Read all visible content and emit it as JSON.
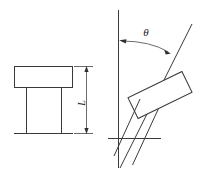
{
  "figure": {
    "background_color": "#ffffff",
    "line_color": "#3a3a3a",
    "label_color": "#1d1d1d",
    "width": 201,
    "height": 181
  },
  "left_view": {
    "name": "upright-view",
    "description": "T-shaped structure standing upright on a baseline",
    "head": {
      "shape": "rectangle",
      "x": 14,
      "y": 66,
      "width": 59,
      "height": 22
    },
    "legs": [
      {
        "x": 26,
        "y_top": 88,
        "y_bottom": 133
      },
      {
        "x": 61,
        "y_top": 88,
        "y_bottom": 133
      }
    ],
    "baseline": {
      "x_start": 14,
      "x_end": 73,
      "y": 133
    },
    "dimension": {
      "label": "L",
      "orientation": "vertical",
      "x": 86,
      "y_top": 67,
      "y_bottom": 134,
      "extension_top_y": 67,
      "extension_bottom_y": 134,
      "extension_x_start": 73,
      "extension_x_end": 93
    }
  },
  "right_view": {
    "name": "tilted-view",
    "description": "Same T-shaped structure rotated by angle theta from the vertical reference axis",
    "reference_axis": {
      "name": "vertical-reference-line",
      "x": 118,
      "y_top": 10,
      "y_bottom": 168
    },
    "tilt_axis": {
      "name": "tilted-centerline",
      "x_top": 192,
      "y_top": 24,
      "x_bottom": 120,
      "y_bottom": 168
    },
    "angle": {
      "label": "θ",
      "label_x": 146,
      "label_y": 33,
      "arc_start_x": 120,
      "arc_start_y": 40,
      "arc_end_x": 170,
      "arc_end_y": 54,
      "arrow_both_ends": true
    },
    "head": {
      "shape": "rotated-rectangle",
      "rotation_deg": -26,
      "center_x": 160,
      "center_y": 95,
      "width": 60,
      "height": 23
    },
    "legs": [
      {
        "x_top": 140,
        "y_top": 100,
        "x_bottom": 115,
        "y_bottom": 155
      },
      {
        "x_top": 158,
        "y_top": 108,
        "x_bottom": 133,
        "y_bottom": 163
      }
    ],
    "baseline": {
      "x_start": 108,
      "x_end": 161,
      "y": 138
    }
  }
}
